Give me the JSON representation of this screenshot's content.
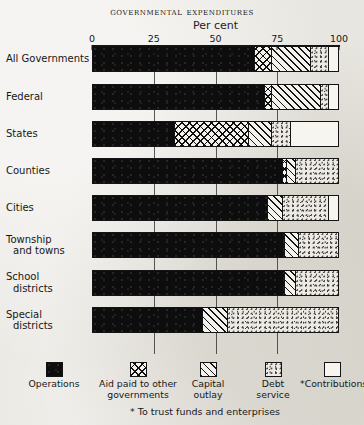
{
  "chart_data": {
    "type": "bar",
    "orientation": "horizontal",
    "stacked": true,
    "title": "Governmental Expenditures",
    "xlabel": "Per cent",
    "ylabel": "",
    "xlim": [
      0,
      100
    ],
    "xticks": [
      0,
      25,
      50,
      75,
      100
    ],
    "xticklabels": [
      "0",
      "25",
      "50",
      "75",
      "100"
    ],
    "grid": true,
    "legend_position": "bottom",
    "footnote": "* To trust funds and enterprises",
    "categories": [
      "All Governments",
      "Federal",
      "States",
      "Counties",
      "Cities",
      "Township and towns",
      "School districts",
      "Special districts"
    ],
    "category_lines": [
      [
        "All Governments"
      ],
      [
        "Federal"
      ],
      [
        "States"
      ],
      [
        "Counties"
      ],
      [
        "Cities"
      ],
      [
        "Township",
        "and towns"
      ],
      [
        "School",
        "districts"
      ],
      [
        "Special",
        "districts"
      ]
    ],
    "series": [
      {
        "name": "Operations",
        "fill": "solid-black",
        "values": [
          66.0,
          70.0,
          33.5,
          77.5,
          71.5,
          78.5,
          78.5,
          45.0
        ]
      },
      {
        "name": "Aid paid to other governments",
        "fill": "crosshatch",
        "values": [
          7.0,
          3.0,
          30.0,
          1.5,
          0.0,
          0.0,
          0.0,
          0.0
        ]
      },
      {
        "name": "Capital outlay",
        "fill": "diagonal-hatch",
        "values": [
          16.0,
          20.0,
          9.5,
          4.0,
          6.0,
          5.5,
          4.5,
          10.0
        ]
      },
      {
        "name": "Debt service",
        "fill": "stipple",
        "values": [
          7.5,
          3.5,
          8.0,
          17.0,
          19.0,
          16.0,
          17.0,
          45.0
        ]
      },
      {
        "name": "Contributions",
        "fill": "white",
        "values": [
          3.5,
          3.5,
          19.0,
          0.0,
          3.5,
          0.0,
          0.0,
          0.0
        ]
      }
    ],
    "legend_entries": [
      {
        "label_lines": [
          "Operations"
        ],
        "fill": "solid-black"
      },
      {
        "label_lines": [
          "Aid paid to other",
          "governments"
        ],
        "fill": "crosshatch"
      },
      {
        "label_lines": [
          "Capital",
          "outlay"
        ],
        "fill": "diagonal-hatch"
      },
      {
        "label_lines": [
          "Debt",
          "service"
        ],
        "fill": "stipple"
      },
      {
        "label_lines": [
          "*Contributions"
        ],
        "fill": "white"
      }
    ],
    "colors": {
      "operations": "#0d0d0d",
      "aid": "#f4f2ec",
      "capital": "#f4f2ec",
      "debt": "#eceae3",
      "contributions": "#f7f5ef",
      "ink": "#141414",
      "paper": "#e8e6e0"
    }
  }
}
